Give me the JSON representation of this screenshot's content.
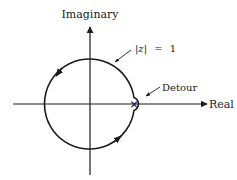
{
  "diagram": {
    "type": "complex-plane contour",
    "axes": {
      "vertical_label": "Imaginary",
      "horizontal_label": "Real"
    },
    "contour": {
      "label": "|z| = 1",
      "label_prefix": "|z|",
      "label_eq": "=",
      "label_value": "1",
      "shape": "unit circle",
      "direction": "counterclockwise"
    },
    "detour": {
      "label": "Detour",
      "marker": "×",
      "location": "z = 1 (on real axis)"
    },
    "colors": {
      "stroke": "#1a1a1a",
      "background": "#ffffff"
    }
  }
}
